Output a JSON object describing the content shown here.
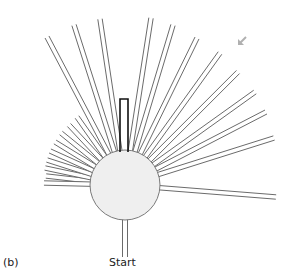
{
  "figure": {
    "panel_label": "(b)",
    "start_label": "Start"
  },
  "maze": {
    "center": [
      125,
      185
    ],
    "hub_radius": 35,
    "arm_half_width": 2.2,
    "arm_stroke": "#6b6b6b",
    "hub_fill": "#efefef",
    "hub_stroke": "#7a7a7a",
    "highlight_stroke": "#111111",
    "arm_endpoints": [
      [
        47,
        37
      ],
      [
        74,
        25
      ],
      [
        100,
        19
      ],
      [
        151,
        18
      ],
      [
        173,
        25
      ],
      [
        197,
        38
      ],
      [
        220,
        53
      ],
      [
        238,
        72
      ],
      [
        255,
        92
      ],
      [
        266,
        112
      ],
      [
        274,
        138
      ],
      [
        46,
        176
      ],
      [
        45,
        168
      ],
      [
        47,
        160
      ],
      [
        50,
        151
      ],
      [
        55,
        142
      ],
      [
        61,
        133
      ],
      [
        69,
        125
      ],
      [
        77,
        117
      ]
    ],
    "right_horizontal_arm": [
      276,
      197
    ],
    "left_horizontal_arm": [
      44,
      183
    ],
    "start_arm_end": [
      125,
      257
    ],
    "highlight_arm": {
      "x": 120,
      "y": 99,
      "width": 8,
      "bottom": 152
    },
    "arrow": {
      "tail": [
        246,
        37
      ],
      "head": [
        238,
        45
      ],
      "color": "#b0b0b0"
    }
  }
}
